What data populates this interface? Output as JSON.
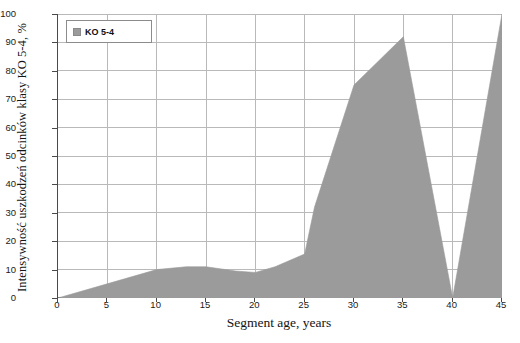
{
  "chart_data": {
    "type": "area",
    "title": "",
    "xlabel": "Segment age, years",
    "ylabel": "Intensywność uszkodzeń odcinków klasy KO 5-4, %",
    "xlim": [
      0,
      45
    ],
    "ylim": [
      0,
      100
    ],
    "xticks": [
      0,
      5,
      10,
      15,
      20,
      25,
      30,
      35,
      40,
      45
    ],
    "yticks": [
      0,
      10,
      20,
      30,
      40,
      50,
      60,
      70,
      80,
      90,
      100
    ],
    "grid": true,
    "legend_position": "top-left",
    "series": [
      {
        "name": "KO 5-4",
        "color": "#9b9b9b",
        "x": [
          0,
          5,
          10,
          13,
          15,
          18,
          20,
          22,
          25,
          26,
          30,
          35,
          40,
          45
        ],
        "values": [
          0,
          5,
          10,
          11,
          11,
          9.5,
          9,
          11,
          15.5,
          32,
          75,
          92,
          0,
          100
        ]
      }
    ]
  },
  "legend": {
    "entries": [
      {
        "label": "KO 5-4",
        "swatch_color": "#9b9b9b"
      }
    ]
  },
  "axes": {
    "x_title": "Segment age, years",
    "y_title": "Intensywność uszkodzeń odcinków klasy KO 5-4, %",
    "x_tick_labels": [
      "0",
      "5",
      "10",
      "15",
      "20",
      "25",
      "30",
      "35",
      "40",
      "45"
    ],
    "y_tick_labels": [
      "0",
      "10",
      "20",
      "30",
      "40",
      "50",
      "60",
      "70",
      "80",
      "90",
      "100"
    ]
  },
  "colors": {
    "series_fill": "#9b9b9b",
    "grid": "#b9b9b9",
    "axis": "#4a4a4a",
    "background": "#ffffff",
    "text": "#1a1a1a"
  }
}
